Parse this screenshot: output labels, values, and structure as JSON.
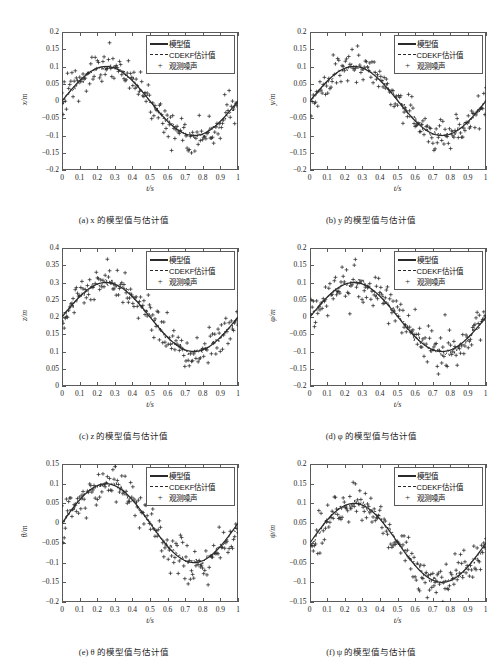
{
  "figure": {
    "top_cut_text": "",
    "legend": {
      "model_label": "模型值",
      "estimate_label": "CDEKF估计值",
      "noise_label": "观测噪声"
    },
    "xlabel": "t/s",
    "xticks": [
      "0",
      "0.1",
      "0.2",
      "0.3",
      "0.4",
      "0.5",
      "0.6",
      "0.7",
      "0.8",
      "0.9",
      "1"
    ],
    "colors": {
      "line": "#2a2a2a",
      "axis": "#5a5a5a",
      "marker": "#2a2a2a",
      "background": "#ffffff"
    }
  },
  "chart_data": [
    {
      "type": "scatter",
      "panel": "a",
      "caption": "(a) x 的模型值与估计值",
      "title": "",
      "xlabel": "t/s",
      "ylabel": "x/m",
      "xlim": [
        0,
        1
      ],
      "ylim": [
        -0.2,
        0.2
      ],
      "yticks": [
        "0.2",
        "0.15",
        "0.1",
        "0.05",
        "0",
        "-0.05",
        "-0.1",
        "-0.15",
        "-0.2"
      ],
      "grid": false,
      "legend_position": "top-right",
      "amplitude": 0.1,
      "offset": 0,
      "noise_sigma": 0.028,
      "n_points": 160,
      "series": [
        {
          "name": "模型值",
          "style": "solid"
        },
        {
          "name": "CDEKF估计值",
          "style": "dashed"
        },
        {
          "name": "观测噪声",
          "style": "plus-markers"
        }
      ]
    },
    {
      "type": "scatter",
      "panel": "b",
      "caption": "(b) y 的模型值与估计值",
      "title": "",
      "xlabel": "t/s",
      "ylabel": "y/m",
      "xlim": [
        0,
        1
      ],
      "ylim": [
        -0.2,
        0.2
      ],
      "yticks": [
        "0.2",
        "0.15",
        "0.1",
        "0.05",
        "0",
        "-0.05",
        "-0.1",
        "-0.15",
        "-0.2"
      ],
      "grid": false,
      "legend_position": "top-right",
      "amplitude": 0.1,
      "offset": 0,
      "noise_sigma": 0.026,
      "n_points": 160,
      "series": [
        {
          "name": "模型值",
          "style": "solid"
        },
        {
          "name": "CDEKF估计值",
          "style": "dashed"
        },
        {
          "name": "观测噪声",
          "style": "plus-markers"
        }
      ]
    },
    {
      "type": "scatter",
      "panel": "c",
      "caption": "(c) z 的模型值与估计值",
      "title": "",
      "xlabel": "t/s",
      "ylabel": "z/m",
      "xlim": [
        0,
        1
      ],
      "ylim": [
        0,
        0.4
      ],
      "yticks": [
        "0.4",
        "0.35",
        "0.3",
        "0.25",
        "0.2",
        "0.15",
        "0.1",
        "0.05",
        "0"
      ],
      "grid": false,
      "legend_position": "top-right",
      "amplitude": 0.1,
      "offset": 0.2,
      "noise_sigma": 0.028,
      "n_points": 160,
      "series": [
        {
          "name": "模型值",
          "style": "solid"
        },
        {
          "name": "CDEKF估计值",
          "style": "dashed"
        },
        {
          "name": "观测噪声",
          "style": "plus-markers"
        }
      ]
    },
    {
      "type": "scatter",
      "panel": "d",
      "caption": "(d) φ 的模型值与估计值",
      "title": "",
      "xlabel": "t/s",
      "ylabel": "φ/m",
      "xlim": [
        0,
        1
      ],
      "ylim": [
        -0.2,
        0.2
      ],
      "yticks": [
        "0.2",
        "0.15",
        "0.1",
        "0.05",
        "0",
        "-0.05",
        "-0.1",
        "-0.15",
        "-0.2"
      ],
      "grid": false,
      "legend_position": "top-right",
      "amplitude": 0.1,
      "offset": 0,
      "noise_sigma": 0.03,
      "n_points": 160,
      "series": [
        {
          "name": "模型值",
          "style": "solid"
        },
        {
          "name": "CDEKF估计值",
          "style": "dashed"
        },
        {
          "name": "观测噪声",
          "style": "plus-markers"
        }
      ]
    },
    {
      "type": "scatter",
      "panel": "e",
      "caption": "(e) θ 的模型值与估计值",
      "title": "",
      "xlabel": "t/s",
      "ylabel": "θ/m",
      "xlim": [
        0,
        1
      ],
      "ylim": [
        -0.2,
        0.15
      ],
      "yticks": [
        "0.15",
        "0.1",
        "0.05",
        "0",
        "-0.05",
        "-0.1",
        "-0.15",
        "-0.2"
      ],
      "grid": false,
      "legend_position": "top-right",
      "amplitude": 0.1,
      "offset": 0,
      "noise_sigma": 0.027,
      "n_points": 160,
      "series": [
        {
          "name": "模型值",
          "style": "solid"
        },
        {
          "name": "CDEKF估计值",
          "style": "dashed"
        },
        {
          "name": "观测噪声",
          "style": "plus-markers"
        }
      ]
    },
    {
      "type": "scatter",
      "panel": "f",
      "caption": "(f) ψ 的模型值与估计值",
      "title": "",
      "xlabel": "t/s",
      "ylabel": "ψ/m",
      "xlim": [
        0,
        1
      ],
      "ylim": [
        -0.15,
        0.2
      ],
      "yticks": [
        "0.2",
        "0.15",
        "0.1",
        "0.05",
        "0",
        "-0.05",
        "-0.1",
        "-0.15"
      ],
      "grid": false,
      "legend_position": "top-right",
      "amplitude": 0.1,
      "offset": 0,
      "noise_sigma": 0.027,
      "n_points": 160,
      "series": [
        {
          "name": "模型值",
          "style": "solid"
        },
        {
          "name": "CDEKF估计值",
          "style": "dashed"
        },
        {
          "name": "观测噪声",
          "style": "plus-markers"
        }
      ]
    }
  ]
}
